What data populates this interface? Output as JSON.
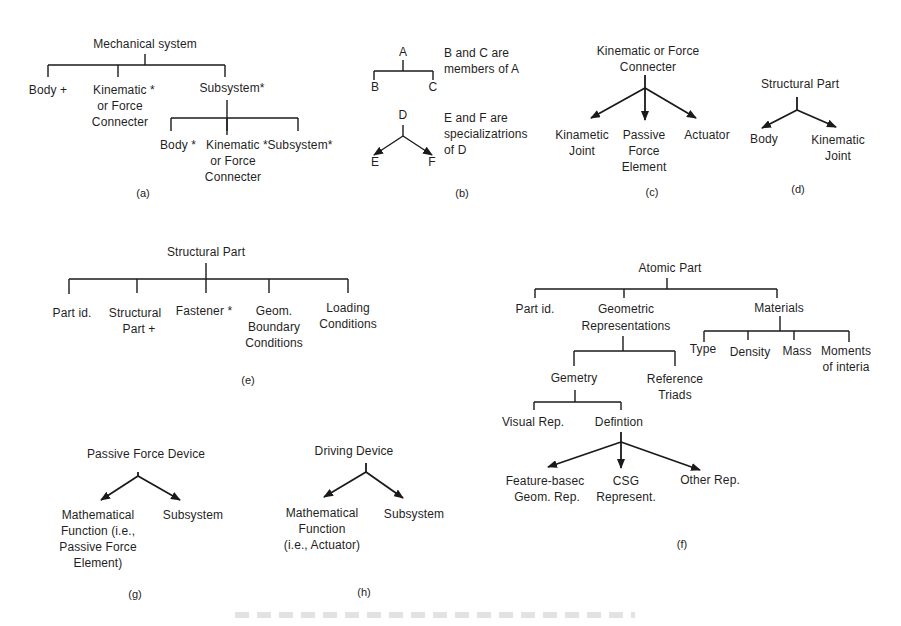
{
  "figure": {
    "panels": {
      "a": {
        "caption": "(a)",
        "root": "Mechanical system",
        "level1": [
          "Body +",
          "Kinematic *\nor Force\nConnecter",
          "Subsystem*"
        ],
        "level1_short": {
          "body": "Body +",
          "kin1": "Kinematic  *",
          "kin2": "or Force",
          "kin3": "Connecter",
          "sub": "Subsystem*"
        },
        "level2": {
          "body": "Body *",
          "kin1": "Kinematic *",
          "kin2": "or Force",
          "kin3": "Connecter",
          "sub": "Subsystem*"
        }
      },
      "b": {
        "caption": "(b)",
        "member_parent": "A",
        "member_children": [
          "B",
          "C"
        ],
        "member_note_1": "B and C are",
        "member_note_2": "members of A",
        "spec_parent": "D",
        "spec_children": [
          "E",
          "F"
        ],
        "spec_note_1": "E and F are",
        "spec_note_2": "specializatrions",
        "spec_note_3": "of D"
      },
      "c": {
        "caption": "(c)",
        "root_1": "Kinematic or Force",
        "root_2": "Connecter",
        "children": {
          "joint_1": "Kinametic",
          "joint_2": "Joint",
          "passive_1": "Passive",
          "passive_2": "Force",
          "passive_3": "Element",
          "actuator": "Actuator"
        }
      },
      "d": {
        "caption": "(d)",
        "root": "Structural Part",
        "children": {
          "body": "Body",
          "joint_1": "Kinematic",
          "joint_2": "Joint"
        }
      },
      "e": {
        "caption": "(e)",
        "root": "Structural Part",
        "children": {
          "part_id": "Part id.",
          "sp_1": "Structural",
          "sp_2": "Part +",
          "fastener": "Fastener *",
          "geom_1": "Geom.",
          "geom_2": "Boundary",
          "geom_3": "Conditions",
          "load_1": "Loading",
          "load_2": "Conditions"
        }
      },
      "f": {
        "caption": "(f)",
        "root": "Atomic Part",
        "part_id": "Part id.",
        "geo_1": "Geometric",
        "geo_2": "Representations",
        "materials": "Materials",
        "materials_children": {
          "type": "Type",
          "density": "Density",
          "mass": "Mass",
          "moi_1": "Moments",
          "moi_2": "of interia"
        },
        "gemetry": "Gemetry",
        "ref_1": "Reference",
        "ref_2": "Triads",
        "visual": "Visual Rep.",
        "defintion": "Defintion",
        "def_children": {
          "fb_1": "Feature-basec",
          "fb_2": "Geom. Rep.",
          "csg_1": "CSG",
          "csg_2": "Represent.",
          "other": "Other Rep."
        }
      },
      "g": {
        "caption": "(g)",
        "root": "Passive Force Device",
        "children": {
          "math_1": "Mathematical",
          "math_2": "Function (i.e.,",
          "math_3": "Passive Force",
          "math_4": "Element)",
          "sub": "Subsystem"
        }
      },
      "h": {
        "caption": "(h)",
        "root": "Driving Device",
        "children": {
          "math_1": "Mathematical",
          "math_2": "Function",
          "math_3": "(i.e., Actuator)",
          "sub": "Subsystem"
        }
      }
    },
    "colors": {
      "ink": "#1a1a1a",
      "background": "#ffffff"
    }
  }
}
